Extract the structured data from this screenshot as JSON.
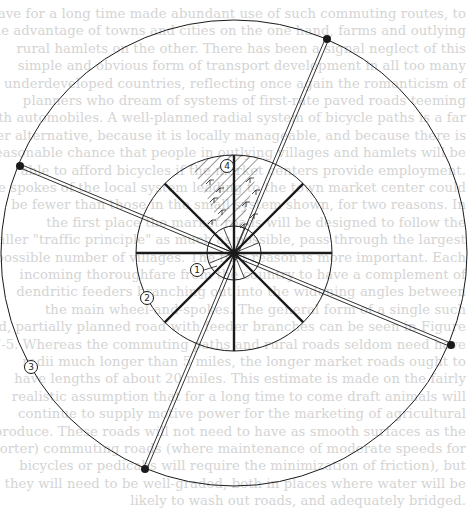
{
  "figure": {
    "center": [
      234,
      253
    ],
    "radii": {
      "inner": 27,
      "middle": 98,
      "outer": 233
    },
    "thick_spoke_angles_deg": [
      0,
      45,
      90,
      135,
      180,
      225,
      270,
      315
    ],
    "thin_spoke_count": 16,
    "roads": [
      {
        "id": "road-a",
        "from": [
          327,
          39
        ],
        "to": [
          145,
          469
        ]
      },
      {
        "id": "road-b",
        "from": [
          20,
          166
        ],
        "to": [
          451,
          345
        ]
      }
    ],
    "hatched_sector": {
      "start_deg": -116,
      "end_deg": -74,
      "r_inner": 27,
      "r_outer": 98
    },
    "labels": [
      {
        "id": "1",
        "text": "1",
        "x": 197,
        "y": 270
      },
      {
        "id": "2",
        "text": "2",
        "x": 147,
        "y": 298
      },
      {
        "id": "3",
        "text": "3",
        "x": 31,
        "y": 367
      },
      {
        "id": "4",
        "text": "4",
        "x": 227,
        "y": 166
      }
    ],
    "colors": {
      "ink": "#1a1a1a",
      "ghost_text": "#d4d4d4",
      "paper": "#ffffff"
    }
  },
  "ghost_text": [
    "have for a long time made abundant use of such commuting routes, to",
    "the advantage of towns and cities on the one hand, farms and outlying",
    "rural hamlets on the other. There has been a signal neglect of this",
    "simple and obvious form of transport development in all too many",
    "underdeveloped countries, reflecting once again the romanticism of",
    "planners who dream of systems of first-rate paved roads teeming",
    "with automobiles. A well-planned radial system of bicycle paths is a far",
    "wiser alternative, because it is locally manageable, and because there is",
    "a reasonable chance that people in outlying villages and hamlets will be",
    "able to afford bicycles if the market centers provide employment.",
    "The spokes of the local system leading to the town market center could",
    "be fewer than those in the small system shown, for two reasons. In",
    "the first place the market roads will be designed to follow the",
    "Christaller \"traffic principle\" as much as possible, pass through the largest",
    "possible number of villages. The first reason is more important. Each",
    "incoming thoroughfare from the country to have a complement of",
    "dendritic feeders branching out into the widening angles between",
    "the main wheel-and-spokes. The general form of a single such",
    "road, partially planned road with feeder branches can be seen in Figure",
    "7-5. Whereas the commuting paths and rural roads seldom need have",
    "radii much longer than 5 miles, the longer market roads ought to",
    "have lengths of about 20 miles. This estimate is made on the fairly",
    "realistic assumption that for a long time to come draft animals will",
    "continue to supply motive power for the marketing of agricultural",
    "produce. These roads will not need to have as smooth surfaces as the",
    "(shorter) commuting roads (where maintenance of moderate speeds for",
    "bicycles or pedicabs will require the minimization of friction), but",
    "they will need to be well-graded, both in places where water will be",
    "likely to wash out roads, and adequately bridged."
  ]
}
